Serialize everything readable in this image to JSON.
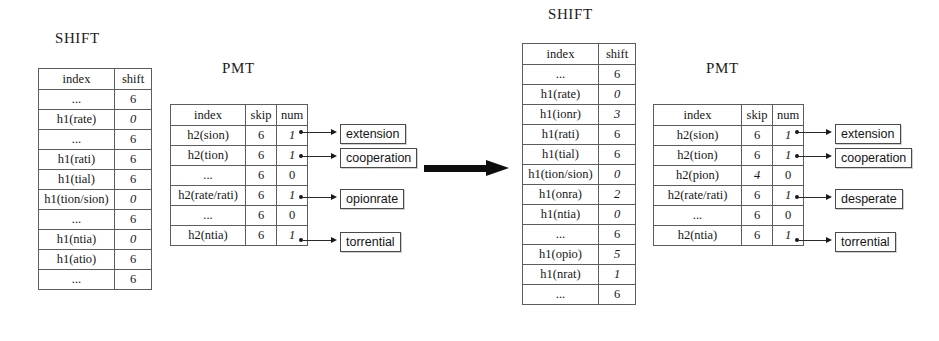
{
  "diagram": {
    "transition_arrow": "right-arrow"
  },
  "left_group": {
    "shift": {
      "title": "SHIFT",
      "columns": [
        "index",
        "shift"
      ],
      "rows": [
        {
          "index": "...",
          "shift": "6",
          "emphasis": false
        },
        {
          "index": "h1(rate)",
          "shift": "0",
          "emphasis": true
        },
        {
          "index": "...",
          "shift": "6",
          "emphasis": false
        },
        {
          "index": "h1(rati)",
          "shift": "6",
          "emphasis": false
        },
        {
          "index": "h1(tial)",
          "shift": "6",
          "emphasis": false
        },
        {
          "index": "h1(tion/sion)",
          "shift": "0",
          "emphasis": true
        },
        {
          "index": "...",
          "shift": "6",
          "emphasis": false
        },
        {
          "index": "h1(ntia)",
          "shift": "0",
          "emphasis": true
        },
        {
          "index": "h1(atio)",
          "shift": "6",
          "emphasis": false
        },
        {
          "index": "...",
          "shift": "6",
          "emphasis": false
        }
      ]
    },
    "pmt": {
      "title": "PMT",
      "columns": [
        "index",
        "skip",
        "num"
      ],
      "rows": [
        {
          "index": "h2(sion)",
          "skip": "6",
          "num": "1",
          "skip_emphasis": false,
          "num_emphasis": true,
          "linked": true
        },
        {
          "index": "h2(tion)",
          "skip": "6",
          "num": "1",
          "skip_emphasis": false,
          "num_emphasis": true,
          "linked": true
        },
        {
          "index": "...",
          "skip": "6",
          "num": "0",
          "skip_emphasis": false,
          "num_emphasis": false,
          "linked": false
        },
        {
          "index": "h2(rate/rati)",
          "skip": "6",
          "num": "1",
          "skip_emphasis": false,
          "num_emphasis": true,
          "linked": true
        },
        {
          "index": "...",
          "skip": "6",
          "num": "0",
          "skip_emphasis": false,
          "num_emphasis": false,
          "linked": false
        },
        {
          "index": "h2(ntia)",
          "skip": "6",
          "num": "1",
          "skip_emphasis": false,
          "num_emphasis": true,
          "linked": true
        }
      ]
    },
    "matches": [
      {
        "word": "extension"
      },
      {
        "word": "cooperation"
      },
      {
        "word": "opionrate"
      },
      {
        "word": "torrential"
      }
    ]
  },
  "right_group": {
    "shift": {
      "title": "SHIFT",
      "columns": [
        "index",
        "shift"
      ],
      "rows": [
        {
          "index": "...",
          "shift": "6",
          "emphasis": false
        },
        {
          "index": "h1(rate)",
          "shift": "0",
          "emphasis": true
        },
        {
          "index": "h1(ionr)",
          "shift": "3",
          "emphasis": true
        },
        {
          "index": "h1(rati)",
          "shift": "6",
          "emphasis": false
        },
        {
          "index": "h1(tial)",
          "shift": "6",
          "emphasis": false
        },
        {
          "index": "h1(tion/sion)",
          "shift": "0",
          "emphasis": true
        },
        {
          "index": "h1(onra)",
          "shift": "2",
          "emphasis": true
        },
        {
          "index": "h1(ntia)",
          "shift": "0",
          "emphasis": true
        },
        {
          "index": "...",
          "shift": "6",
          "emphasis": false
        },
        {
          "index": "h1(opio)",
          "shift": "5",
          "emphasis": true
        },
        {
          "index": "h1(nrat)",
          "shift": "1",
          "emphasis": true
        },
        {
          "index": "...",
          "shift": "6",
          "emphasis": false
        }
      ]
    },
    "pmt": {
      "title": "PMT",
      "columns": [
        "index",
        "skip",
        "num"
      ],
      "rows": [
        {
          "index": "h2(sion)",
          "skip": "6",
          "num": "1",
          "skip_emphasis": false,
          "num_emphasis": true,
          "linked": true
        },
        {
          "index": "h2(tion)",
          "skip": "6",
          "num": "1",
          "skip_emphasis": false,
          "num_emphasis": true,
          "linked": true
        },
        {
          "index": "h2(pion)",
          "skip": "4",
          "num": "0",
          "skip_emphasis": true,
          "num_emphasis": false,
          "linked": false
        },
        {
          "index": "h2(rate/rati)",
          "skip": "6",
          "num": "1",
          "skip_emphasis": false,
          "num_emphasis": true,
          "linked": true
        },
        {
          "index": "...",
          "skip": "6",
          "num": "0",
          "skip_emphasis": false,
          "num_emphasis": false,
          "linked": false
        },
        {
          "index": "h2(ntia)",
          "skip": "6",
          "num": "1",
          "skip_emphasis": false,
          "num_emphasis": true,
          "linked": true
        }
      ]
    },
    "matches": [
      {
        "word": "extension"
      },
      {
        "word": "cooperation"
      },
      {
        "word": "desperate"
      },
      {
        "word": "torrential"
      }
    ]
  }
}
